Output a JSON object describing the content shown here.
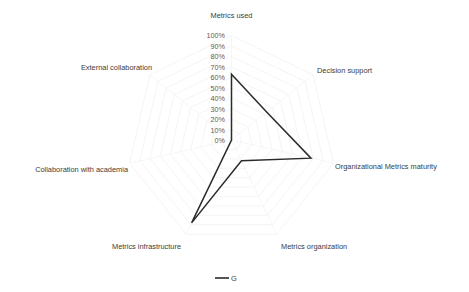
{
  "chart_data": {
    "type": "radar",
    "title": "",
    "categories": [
      "Metrics used",
      "Decision support",
      "Organizational Metrics maturity",
      "Metrics organization",
      "Metrics infrastructure",
      "Collaboration with academia",
      "External collaboration"
    ],
    "series": [
      {
        "name": "G",
        "values": [
          63,
          43,
          78,
          22,
          88,
          0,
          0
        ]
      }
    ],
    "tick_labels": [
      "0%",
      "10%",
      "20%",
      "30%",
      "40%",
      "50%",
      "60%",
      "70%",
      "80%",
      "90%",
      "100%"
    ],
    "tick_values": [
      0,
      10,
      20,
      30,
      40,
      50,
      60,
      70,
      80,
      90,
      100
    ],
    "rlim": [
      0,
      100
    ],
    "grid": true,
    "legend_position": "bottom",
    "xlabel": "",
    "ylabel": "",
    "colors": {
      "series": "#2b2b2b",
      "grid": "#efefef",
      "text": "#3b3b3b",
      "background": "#ffffff"
    }
  },
  "legend": {
    "entries": [
      {
        "label": "G"
      }
    ]
  },
  "axis_labels": {
    "metrics_used": "Metrics used",
    "decision_support": "Decision support",
    "organizational_metrics_maturity": "Organizational Metrics maturity",
    "metrics_organization": "Metrics organization",
    "metrics_infrastructure": "Metrics infrastructure",
    "collaboration_with_academia": "Collaboration with academia",
    "external_collaboration": "External collaboration"
  },
  "ticks": {
    "t0": "0%",
    "t1": "10%",
    "t2": "20%",
    "t3": "30%",
    "t4": "40%",
    "t5": "50%",
    "t6": "60%",
    "t7": "70%",
    "t8": "80%",
    "t9": "90%",
    "t10": "100%"
  }
}
